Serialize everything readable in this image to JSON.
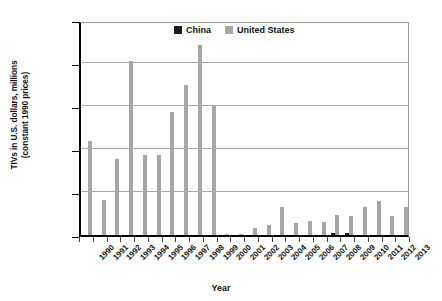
{
  "chart_data": {
    "type": "bar",
    "title": "",
    "xlabel": "Year",
    "ylabel": "TIVs in U.S. dollars, millions\n(constant 1990 prices)",
    "ylim": [
      0,
      2500
    ],
    "yticks": [
      0,
      500,
      1000,
      1500,
      2000,
      2500
    ],
    "ytick_labels": [
      "0",
      "500",
      "1,000",
      "1,500",
      "2,000",
      "2,500"
    ],
    "grid": true,
    "legend_position": "top-center",
    "categories": [
      "1990",
      "1991",
      "1992",
      "1993",
      "1994",
      "1995",
      "1996",
      "1997",
      "1998",
      "1999",
      "2000",
      "2001",
      "2002",
      "2003",
      "2004",
      "2005",
      "2006",
      "2007",
      "2008",
      "2009",
      "2010",
      "2011",
      "2012",
      "2013"
    ],
    "series": [
      {
        "name": "China",
        "color": "#1a1a1a",
        "values": [
          0,
          0,
          0,
          0,
          0,
          0,
          0,
          0,
          0,
          0,
          0,
          0,
          0,
          0,
          0,
          0,
          0,
          0,
          20,
          20,
          0,
          0,
          0,
          0
        ]
      },
      {
        "name": "United States",
        "color": "#a6a6a6",
        "values": [
          1095,
          405,
          885,
          2020,
          925,
          925,
          1435,
          1745,
          2210,
          1500,
          10,
          15,
          85,
          115,
          320,
          145,
          165,
          150,
          235,
          225,
          330,
          400,
          220,
          330
        ]
      }
    ]
  },
  "legend": {
    "items": [
      {
        "label": "China",
        "swatch": "swatch-china"
      },
      {
        "label": "United States",
        "swatch": "swatch-united-states"
      }
    ]
  },
  "axes": {
    "x_title": "Year",
    "y_title": "TIVs in U.S. dollars, millions\n(constant 1990 prices)"
  }
}
